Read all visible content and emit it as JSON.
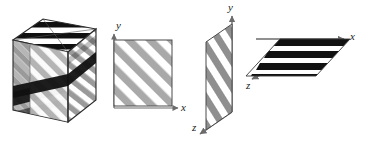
{
  "figure": {
    "type": "technical-illustration",
    "background_color": "#ffffff"
  },
  "colors": {
    "stripe_gray": "#9a9a9a",
    "stripe_gray_light": "#b4b4b4",
    "stripe_black": "#111111",
    "outline": "#4a4a4a",
    "outline_dark": "#2b2b2b",
    "axis": "#6b6b6b",
    "label": "#1a1a1a",
    "white": "#ffffff"
  },
  "panels": [
    {
      "id": "cube",
      "name": "striped-cube",
      "faces": [
        {
          "name": "top-face",
          "pattern": "black-horizontal-stripes",
          "stripe_color": "#111111"
        },
        {
          "name": "left-face",
          "pattern": "gray-crosshatch-diagonal",
          "stripe_color": "#9a9a9a"
        },
        {
          "name": "front-face",
          "pattern": "gray-diagonal-stripes",
          "stripe_color": "#b4b4b4"
        },
        {
          "name": "right-face",
          "pattern": "gray-diagonal-stripes",
          "stripe_color": "#9a9a9a"
        }
      ]
    },
    {
      "id": "square-2d",
      "name": "striped-square-xy",
      "pattern": "gray-diagonal-stripes",
      "axes": [
        {
          "name": "y-axis",
          "label": "y",
          "direction": "up"
        },
        {
          "name": "x-axis",
          "label": "x",
          "direction": "right"
        }
      ]
    },
    {
      "id": "vertical-plane",
      "name": "striped-plane-yz",
      "pattern": "gray-diagonal-stripes",
      "axes": [
        {
          "name": "y-axis",
          "label": "y",
          "direction": "up"
        },
        {
          "name": "z-axis",
          "label": "z",
          "direction": "down-left"
        }
      ]
    },
    {
      "id": "horizontal-plane",
      "name": "striped-plane-xz",
      "pattern": "black-stripes-parallel-to-x",
      "axes": [
        {
          "name": "x-axis",
          "label": "x",
          "direction": "right"
        },
        {
          "name": "z-axis",
          "label": "z",
          "direction": "down-left"
        }
      ]
    }
  ],
  "labels": {
    "square_y": "y",
    "square_x": "x",
    "vertical_y": "y",
    "vertical_z": "z",
    "horizontal_x": "x",
    "horizontal_z": "z"
  }
}
